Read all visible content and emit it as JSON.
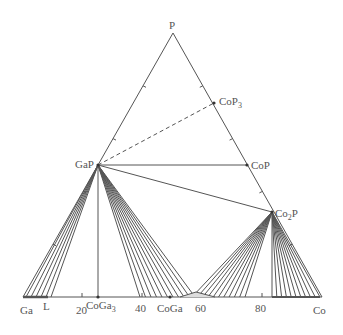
{
  "diagram": {
    "type": "ternary-phase-diagram",
    "vertices": {
      "top": {
        "label": "P",
        "x": 173,
        "y": 33
      },
      "left": {
        "label": "Ga",
        "x": 23,
        "y": 297
      },
      "right": {
        "label": "Co",
        "x": 322,
        "y": 297
      }
    },
    "phases": [
      {
        "id": "CoP3",
        "label": "CoP",
        "sub": "3",
        "x": 214,
        "y": 103
      },
      {
        "id": "CoP",
        "label": "CoP",
        "sub": "",
        "x": 247,
        "y": 165
      },
      {
        "id": "GaP",
        "label": "GaP",
        "sub": "",
        "x": 98,
        "y": 165
      },
      {
        "id": "Co2P",
        "label": "Co",
        "sub": "2",
        "suffix": "P",
        "x": 272,
        "y": 212
      },
      {
        "id": "CoGa3",
        "label": "CoGa",
        "sub": "3",
        "x": 98,
        "y": 297
      },
      {
        "id": "CoGa",
        "label": "CoGa",
        "sub": "",
        "x": 170,
        "y": 297
      }
    ],
    "liquid_label": "L",
    "bottom_axis_ticks": [
      {
        "value": "20",
        "x": 82
      },
      {
        "value": "40",
        "x": 142
      },
      {
        "value": "60",
        "x": 202
      },
      {
        "value": "80",
        "x": 262
      }
    ],
    "line_color": "#555555"
  }
}
